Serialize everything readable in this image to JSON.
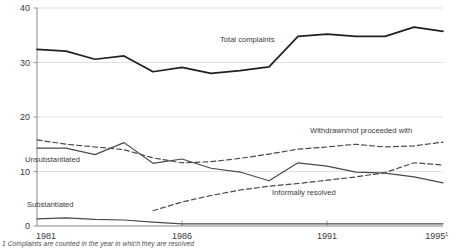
{
  "chart_data": {
    "type": "line",
    "title": "",
    "xlabel": "",
    "ylabel": "",
    "xlim": [
      1981,
      1995
    ],
    "ylim": [
      0,
      40
    ],
    "yticks": [
      0,
      10,
      20,
      30,
      40
    ],
    "ytick_labels": [
      "0",
      "10",
      "20",
      "30",
      "40"
    ],
    "xticks": [
      1981,
      1986,
      1991,
      1995
    ],
    "xtick_labels": [
      "1981",
      "1986",
      "1991",
      "1995"
    ],
    "xtick_superscript": "1",
    "grid": "horizontal",
    "legend": "inline-annotations",
    "x": [
      1981,
      1982,
      1983,
      1984,
      1985,
      1986,
      1987,
      1988,
      1989,
      1990,
      1991,
      1992,
      1993,
      1994,
      1995
    ],
    "series": [
      {
        "name": "Total complaints",
        "style": "solid",
        "label_position": {
          "x": 220,
          "y": 42
        },
        "values": [
          32.4,
          32.1,
          30.6,
          31.2,
          28.3,
          29.1,
          28.0,
          28.5,
          29.2,
          34.8,
          35.2,
          34.8,
          34.8,
          36.5,
          35.7
        ]
      },
      {
        "name": "Unsubstantiated",
        "style": "solid",
        "label_position": {
          "x": 25,
          "y": 162
        },
        "values": [
          14.3,
          14.3,
          13.1,
          15.3,
          11.5,
          12.3,
          10.6,
          9.9,
          8.3,
          11.6,
          11.0,
          9.9,
          9.7,
          9.0,
          7.9
        ]
      },
      {
        "name": "Substantiated",
        "style": "solid",
        "label_position": {
          "x": 27,
          "y": 207
        },
        "values": [
          1.3,
          1.5,
          1.2,
          1.1,
          0.7,
          0.4,
          0.4,
          0.4,
          0.4,
          0.4,
          0.4,
          0.4,
          0.4,
          0.4,
          0.4
        ]
      },
      {
        "name": "Withdrawn/not proceeded with",
        "style": "dashed",
        "label_position": {
          "x": 310,
          "y": 133
        },
        "values": [
          15.8,
          15.0,
          14.5,
          14.0,
          12.5,
          11.6,
          11.8,
          12.4,
          13.2,
          14.1,
          14.5,
          15.0,
          14.5,
          14.7,
          15.4
        ]
      },
      {
        "name": "Informally resolved",
        "style": "dashed",
        "label_position": {
          "x": 272,
          "y": 195
        },
        "values": [
          null,
          null,
          null,
          null,
          2.8,
          4.4,
          5.6,
          6.6,
          7.3,
          7.8,
          8.4,
          9.0,
          9.8,
          11.6,
          11.2
        ]
      }
    ],
    "footnote": "1 Complaints are counted in the year in which they are resolved",
    "colors": {
      "total_complaints": "#231f20",
      "other_series": "#4a4a4a",
      "gridline": "#d9d9d9",
      "axis": "#8a8a8a",
      "text": "#3a3a3a"
    }
  }
}
